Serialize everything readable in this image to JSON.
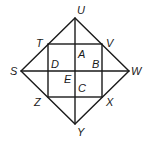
{
  "diagram": {
    "type": "geometry",
    "points": {
      "U": {
        "label": "U",
        "x": 75,
        "y": 18
      },
      "W": {
        "label": "W",
        "x": 129,
        "y": 71
      },
      "Y": {
        "label": "Y",
        "x": 75,
        "y": 124
      },
      "S": {
        "label": "S",
        "x": 21,
        "y": 71
      },
      "T": {
        "label": "T",
        "x": 48,
        "y": 44
      },
      "V": {
        "label": "V",
        "x": 102,
        "y": 44
      },
      "X": {
        "label": "X",
        "x": 102,
        "y": 97
      },
      "Z": {
        "label": "Z",
        "x": 48,
        "y": 97
      }
    },
    "intersections": {
      "A": {
        "label": "A"
      },
      "B": {
        "label": "B"
      },
      "C": {
        "label": "C"
      },
      "D": {
        "label": "D"
      },
      "E": {
        "label": "E"
      }
    },
    "segments": [
      [
        "S",
        "U"
      ],
      [
        "U",
        "W"
      ],
      [
        "W",
        "Y"
      ],
      [
        "Y",
        "S"
      ],
      [
        "T",
        "V"
      ],
      [
        "V",
        "X"
      ],
      [
        "X",
        "Z"
      ],
      [
        "Z",
        "T"
      ],
      [
        "U",
        "Y"
      ],
      [
        "S",
        "W"
      ]
    ]
  }
}
